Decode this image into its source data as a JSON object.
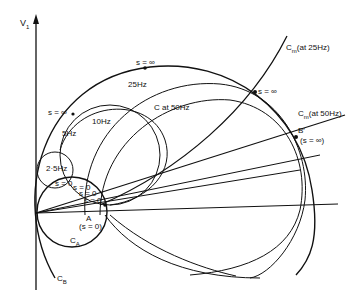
{
  "diagram": {
    "axis": {
      "y_label": "V",
      "y_subscript": "1"
    },
    "circles": [
      {
        "name": "C at 50Hz",
        "label": "C at 50Hz"
      },
      {
        "name": "25Hz",
        "label": "25Hz"
      },
      {
        "name": "10Hz",
        "label": "10Hz"
      },
      {
        "name": "5Hz",
        "label": "5Hz"
      },
      {
        "name": "2.5Hz",
        "label": "2·5Hz"
      },
      {
        "name": "C_A",
        "label": "C",
        "sub": "A"
      },
      {
        "name": "C_B",
        "label": "C",
        "sub": "B"
      }
    ],
    "loci": [
      {
        "name": "Cm at 25Hz",
        "label": "C",
        "sub": "m",
        "suffix": "(at 25Hz)"
      },
      {
        "name": "Cm at 50Hz",
        "label": "C",
        "sub": "m",
        "suffix": "(at 50Hz)"
      }
    ],
    "points": {
      "s_inf_top": "s = ∞",
      "s_inf_left": "s = ∞",
      "s_inf_right": "s = ∞",
      "b_prime": "B′",
      "b_prime_note": "(s = ∞)",
      "s0_1": "s = 0",
      "s0_2": "s = 0",
      "s0_3": "s = 0",
      "s0_4": "s = 0",
      "a_label": "A",
      "a_note": "(s = 0)"
    },
    "colors": {
      "ink": "#111111",
      "background": "#ffffff"
    }
  }
}
